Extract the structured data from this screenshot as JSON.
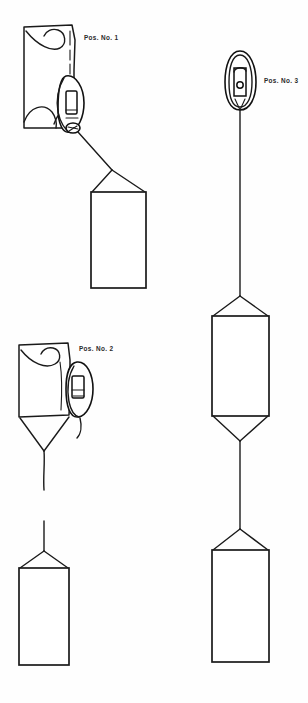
{
  "figure": {
    "background_color": "#ffffff",
    "line_color": "#1a1a1a",
    "width": 308,
    "height": 703
  },
  "labels": {
    "pos1": "Pos. No. 1",
    "pos2": "Pos. No. 2",
    "pos3": "Pos. No. 3"
  },
  "positions": [
    {
      "id": "pos-1",
      "label": "Pos. No. 1",
      "description": "Canopy partially collapsed with deployment bag alongside, load box suspended below by short bridle",
      "components": [
        "canopy",
        "deployment-bag",
        "suspension-lines",
        "load-box"
      ],
      "load_boxes": 1
    },
    {
      "id": "pos-2",
      "label": "Pos. No. 2",
      "description": "Canopy inflating with deployment bag sliding down lines, load box suspended below on long riser",
      "components": [
        "canopy",
        "deployment-bag",
        "bridle",
        "riser",
        "load-box"
      ],
      "load_boxes": 1
    },
    {
      "id": "pos-3",
      "label": "Pos. No. 3",
      "description": "Closed deployment bag at top of long line with two load boxes in tandem below",
      "components": [
        "deployment-bag",
        "long-line",
        "load-box-upper",
        "riser",
        "load-box-lower"
      ],
      "load_boxes": 2
    }
  ]
}
